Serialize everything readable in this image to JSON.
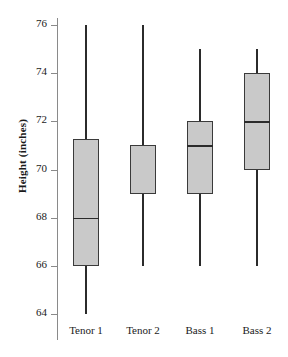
{
  "chart_data": {
    "type": "box",
    "title": "",
    "xlabel": "",
    "ylabel": "Height (inches)",
    "ylim": [
      63.2,
      76.6
    ],
    "yticks": [
      64,
      66,
      68,
      70,
      72,
      74,
      76
    ],
    "ytick_labels": [
      "64",
      "66",
      "68",
      "70",
      "72",
      "74",
      "76"
    ],
    "grid": false,
    "legend": "none",
    "categories": [
      "Tenor 1",
      "Tenor 2",
      "Bass 1",
      "Bass 2"
    ],
    "boxes": [
      {
        "category": "Tenor 1",
        "whisker_low": 64.0,
        "q1": 66.0,
        "median": 68.0,
        "q3": 71.25,
        "whisker_high": 76.0
      },
      {
        "category": "Tenor 2",
        "whisker_low": 66.0,
        "q1": 69.0,
        "median": 71.0,
        "q3": 71.0,
        "whisker_high": 76.0
      },
      {
        "category": "Bass 1",
        "whisker_low": 66.0,
        "q1": 69.0,
        "median": 71.0,
        "q3": 72.0,
        "whisker_high": 75.0
      },
      {
        "category": "Bass 2",
        "whisker_low": 66.0,
        "q1": 70.0,
        "median": 72.0,
        "q3": 74.0,
        "whisker_high": 75.0
      }
    ],
    "colors": {
      "box_fill": "#c9c9c9",
      "box_edge": "#3a3a3a",
      "whisker": "#2b2b2b",
      "median": "#2b2b2b",
      "axis": "#8a8a8a",
      "text": "#1a1a1a",
      "background": "#ffffff"
    }
  }
}
